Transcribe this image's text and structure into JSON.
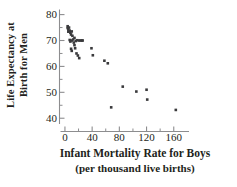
{
  "chart_data": {
    "type": "scatter",
    "title": "",
    "xlabel": "Infant Mortality Rate for Boys",
    "xlabel_sub": "(per thousand live births)",
    "ylabel_line1": "Life Expectancy at",
    "ylabel_line2": "Birth for Men",
    "xlim": [
      -8,
      178
    ],
    "ylim": [
      37,
      81
    ],
    "xticks": [
      0,
      40,
      80,
      120,
      160
    ],
    "xtick_labels": [
      "0",
      "40",
      "80",
      "120",
      "160"
    ],
    "xminor_ticks": [
      20,
      60,
      100,
      140
    ],
    "yticks": [
      40,
      50,
      60,
      70,
      80
    ],
    "ytick_labels": [
      "40",
      "50",
      "60",
      "70",
      "80"
    ],
    "yminor_ticks": [
      45,
      55,
      65,
      75
    ],
    "grid": false,
    "legend": "none",
    "marker": "square",
    "marker_color": "#3a3a3c",
    "marker_size": 2.6,
    "axis_color": "#8d8d8f",
    "points": [
      {
        "x": 4,
        "y": 75.5
      },
      {
        "x": 4,
        "y": 74.8
      },
      {
        "x": 5,
        "y": 74.2
      },
      {
        "x": 5,
        "y": 73.4
      },
      {
        "x": 6,
        "y": 75.0
      },
      {
        "x": 7,
        "y": 73.8
      },
      {
        "x": 8,
        "y": 73.0
      },
      {
        "x": 9,
        "y": 72.3
      },
      {
        "x": 10,
        "y": 73.5
      },
      {
        "x": 11,
        "y": 71.8
      },
      {
        "x": 7,
        "y": 70.2
      },
      {
        "x": 8,
        "y": 69.6
      },
      {
        "x": 10,
        "y": 70.0
      },
      {
        "x": 12,
        "y": 70.4
      },
      {
        "x": 13,
        "y": 69.2
      },
      {
        "x": 14,
        "y": 71.0
      },
      {
        "x": 16,
        "y": 69.8
      },
      {
        "x": 18,
        "y": 70.1
      },
      {
        "x": 21,
        "y": 70.0
      },
      {
        "x": 23,
        "y": 70.0
      },
      {
        "x": 25,
        "y": 70.0
      },
      {
        "x": 26,
        "y": 70.0
      },
      {
        "x": 9,
        "y": 66.8
      },
      {
        "x": 10,
        "y": 66.0
      },
      {
        "x": 15,
        "y": 67.0
      },
      {
        "x": 17,
        "y": 65.0
      },
      {
        "x": 19,
        "y": 64.2
      },
      {
        "x": 21,
        "y": 63.2
      },
      {
        "x": 14,
        "y": 68.2
      },
      {
        "x": 39,
        "y": 67.0
      },
      {
        "x": 41,
        "y": 64.3
      },
      {
        "x": 58,
        "y": 62.2
      },
      {
        "x": 63,
        "y": 61.2
      },
      {
        "x": 68,
        "y": 44.2
      },
      {
        "x": 85,
        "y": 52.2
      },
      {
        "x": 105,
        "y": 50.3
      },
      {
        "x": 120,
        "y": 51.0
      },
      {
        "x": 121,
        "y": 47.2
      },
      {
        "x": 163,
        "y": 43.2
      }
    ]
  }
}
